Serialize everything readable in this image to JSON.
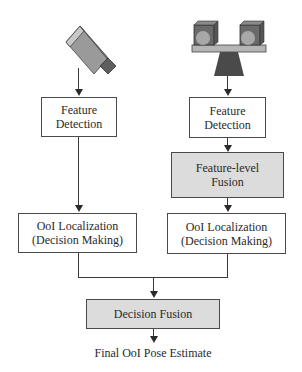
{
  "diagram": {
    "sensors": [
      {
        "name": "single camera",
        "icon": "camera-icon"
      },
      {
        "name": "stereo camera rig",
        "icon": "stereo-camera-icon"
      }
    ],
    "left_branch": {
      "feature_detection": {
        "line1": "Feature",
        "line2": "Detection"
      },
      "ool_localization": {
        "line1": "OoI Localization",
        "line2": "(Decision Making)"
      }
    },
    "right_branch": {
      "feature_detection": {
        "line1": "Feature",
        "line2": "Detection"
      },
      "feature_fusion": {
        "line1": "Feature-level",
        "line2": "Fusion"
      },
      "ool_localization": {
        "line1": "OoI Localization",
        "line2": "(Decision Making)"
      }
    },
    "decision_fusion": {
      "label": "Decision Fusion"
    },
    "output": {
      "label": "Final OoI Pose Estimate"
    },
    "colors": {
      "fusion_fill": "#dcdcdc",
      "box_fill": "#ffffff",
      "stroke": "#4a4a4a"
    }
  }
}
